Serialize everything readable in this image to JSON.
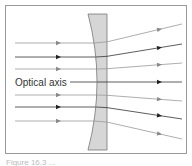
{
  "figure": {
    "frame": {
      "x": 5,
      "y": 5,
      "width": 181,
      "height": 148,
      "stroke": "#999999"
    },
    "lens": {
      "type": "plano-concave",
      "fill": "#d6d6d6",
      "stroke": "#777777",
      "top_y": 14,
      "bottom_y": 150,
      "edge_left_x": 88,
      "center_left_x": 97,
      "right_x": 107
    },
    "axis_label": "Optical axis",
    "rays": [
      {
        "in_y": 43,
        "out_end_y": 24,
        "color": "#999999",
        "arrow": "#888888"
      },
      {
        "in_y": 57,
        "out_end_y": 44,
        "color": "#333333",
        "arrow": "#222222"
      },
      {
        "in_y": 69,
        "out_end_y": 63,
        "color": "#999999",
        "arrow": "#888888"
      },
      {
        "in_y": 82,
        "out_end_y": 82,
        "color": "#333333",
        "arrow": "#222222",
        "is_axis": true
      },
      {
        "in_y": 95,
        "out_end_y": 101,
        "color": "#999999",
        "arrow": "#888888"
      },
      {
        "in_y": 107,
        "out_end_y": 119,
        "color": "#333333",
        "arrow": "#222222"
      },
      {
        "in_y": 121,
        "out_end_y": 139,
        "color": "#999999",
        "arrow": "#888888"
      }
    ],
    "caption": "Figure 16.3 ..."
  }
}
